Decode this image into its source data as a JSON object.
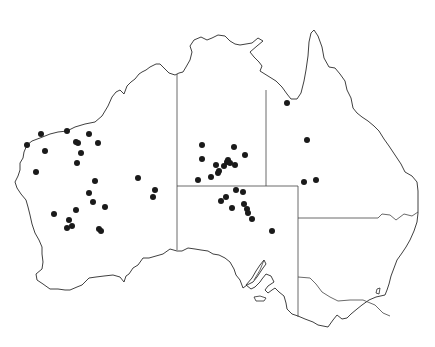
{
  "map": {
    "title": "Australia distribution map",
    "region": "Australia",
    "background_color": "#ffffff",
    "outline_color": "#2a2a2a",
    "dot_color": "#1a1a1a",
    "dot_radius": 3,
    "states": [
      "Western Australia",
      "Northern Territory",
      "South Australia",
      "Queensland",
      "New South Wales",
      "Victoria"
    ],
    "points": [
      [
        41,
        134
      ],
      [
        67,
        131
      ],
      [
        89,
        134
      ],
      [
        27,
        145
      ],
      [
        76,
        142
      ],
      [
        78,
        143
      ],
      [
        98,
        143
      ],
      [
        45,
        151
      ],
      [
        81,
        153
      ],
      [
        77,
        163
      ],
      [
        36,
        172
      ],
      [
        95,
        181
      ],
      [
        138,
        178
      ],
      [
        155,
        190
      ],
      [
        153,
        197
      ],
      [
        89,
        193
      ],
      [
        93,
        202
      ],
      [
        105,
        207
      ],
      [
        76,
        210
      ],
      [
        54,
        214
      ],
      [
        69,
        220
      ],
      [
        72,
        226
      ],
      [
        67,
        228
      ],
      [
        99,
        229
      ],
      [
        101,
        231
      ],
      [
        202,
        145
      ],
      [
        234,
        147
      ],
      [
        202,
        159
      ],
      [
        245,
        155
      ],
      [
        216,
        165
      ],
      [
        228,
        160
      ],
      [
        227,
        162
      ],
      [
        224,
        166
      ],
      [
        230,
        163
      ],
      [
        235,
        165
      ],
      [
        219,
        171
      ],
      [
        218,
        173
      ],
      [
        211,
        177
      ],
      [
        198,
        180
      ],
      [
        236,
        190
      ],
      [
        243,
        192
      ],
      [
        226,
        197
      ],
      [
        221,
        201
      ],
      [
        244,
        204
      ],
      [
        232,
        208
      ],
      [
        247,
        209
      ],
      [
        248,
        213
      ],
      [
        252,
        219
      ],
      [
        272,
        231
      ],
      [
        287,
        103
      ],
      [
        307,
        140
      ],
      [
        316,
        180
      ],
      [
        304,
        182
      ]
    ]
  }
}
